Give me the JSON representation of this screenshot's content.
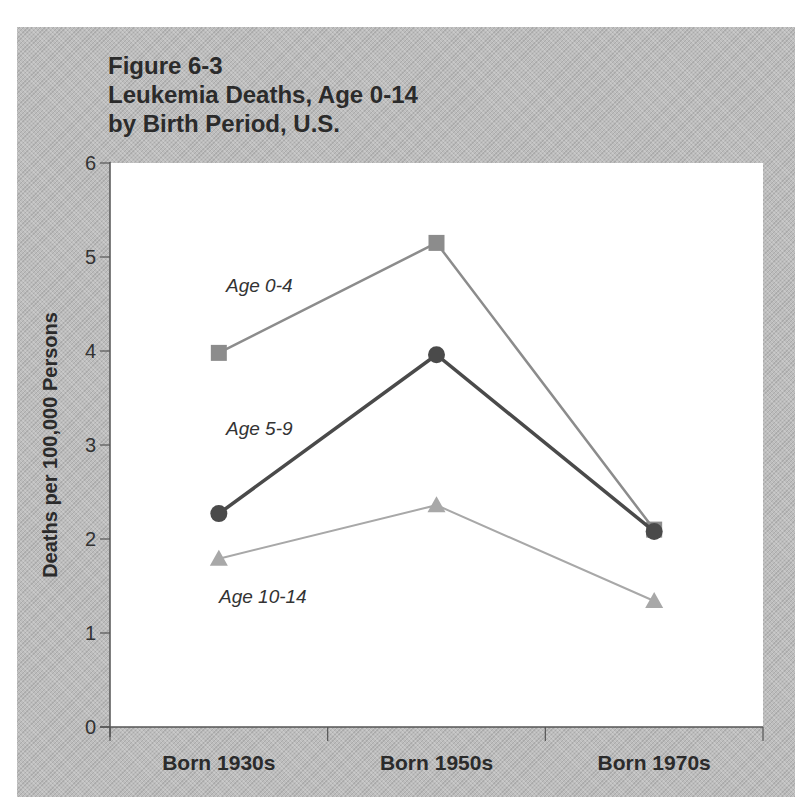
{
  "figure": {
    "title_lines": [
      "Figure 6-3",
      "Leukemia Deaths, Age 0-14",
      "by Birth Period, U.S."
    ],
    "ylabel": "Deaths per 100,000 Persons"
  },
  "chart_data": {
    "type": "line",
    "title": "Figure 6-3 Leukemia Deaths, Age 0-14 by Birth Period, U.S.",
    "xlabel": "",
    "ylabel": "Deaths per 100,000 Persons",
    "categories": [
      "Born 1930s",
      "Born 1950s",
      "Born 1970s"
    ],
    "ylim": [
      0,
      6
    ],
    "yticks": [
      0,
      1,
      2,
      3,
      4,
      5,
      6
    ],
    "grid": false,
    "legend": "inline labels next to series",
    "series": [
      {
        "name": "Age 0-4",
        "marker": "square",
        "color": "#8c8c8c",
        "values": [
          3.98,
          5.15,
          2.1
        ]
      },
      {
        "name": "Age 5-9",
        "marker": "circle",
        "color": "#4a4a4a",
        "values": [
          2.27,
          3.96,
          2.08
        ]
      },
      {
        "name": "Age 10-14",
        "marker": "triangle",
        "color": "#a8a8a8",
        "values": [
          1.79,
          2.36,
          1.34
        ]
      }
    ]
  }
}
